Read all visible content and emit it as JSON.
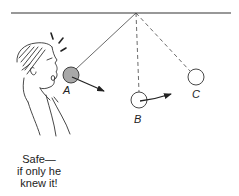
{
  "diagram": {
    "pivot": {
      "x": 136,
      "y": 13
    },
    "ceiling": {
      "x1": 11,
      "x2": 231,
      "y": 13
    },
    "positions": [
      {
        "id": "A",
        "label": "A",
        "cx": 71,
        "cy": 75,
        "r": 8,
        "fill": "#a8a8a8",
        "string": "solid",
        "arrow": {
          "x2": 104,
          "y2": 91
        }
      },
      {
        "id": "B",
        "label": "B",
        "cx": 139,
        "cy": 100,
        "r": 8,
        "fill": "#ffffff",
        "string": "dashed",
        "arrow": {
          "x2": 171,
          "y2": 94
        }
      },
      {
        "id": "C",
        "label": "C",
        "cx": 196,
        "cy": 77,
        "r": 8,
        "fill": "#ffffff",
        "string": "dashed",
        "arrow": null
      }
    ],
    "caption": {
      "lines": [
        "Safe—",
        "if only he",
        "knew it!"
      ]
    },
    "colors": {
      "line": "#333333",
      "ball_filled": "#a8a8a8",
      "background": "#ffffff"
    }
  }
}
